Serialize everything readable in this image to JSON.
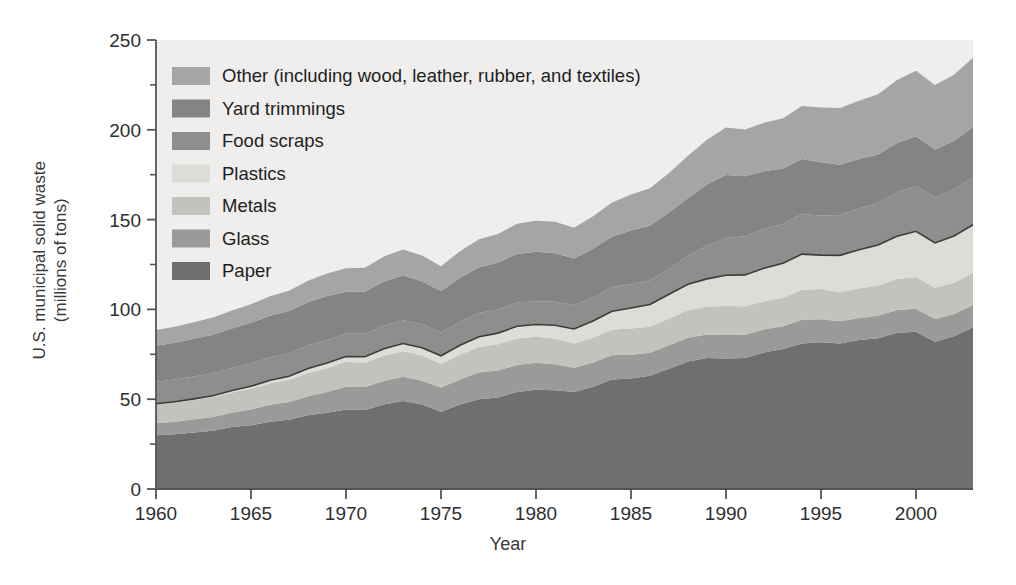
{
  "axes": {
    "ylabel_line1": "U.S. municipal solid waste",
    "ylabel_line2": "(millions of tons)",
    "xlabel": "Year",
    "y_ticks": [
      "0",
      "50",
      "100",
      "150",
      "200",
      "250"
    ],
    "x_ticks": [
      "1960",
      "1965",
      "1970",
      "1975",
      "1980",
      "1985",
      "1990",
      "1995",
      "2000"
    ]
  },
  "legend": {
    "items": [
      {
        "label": "Other (including wood, leather, rubber, and textiles)",
        "color": "#a5a5a3"
      },
      {
        "label": "Yard trimmings",
        "color": "#848482"
      },
      {
        "label": "Food scraps",
        "color": "#8e8e8c"
      },
      {
        "label": "Plastics",
        "color": "#dcdcd8"
      },
      {
        "label": "Metals",
        "color": "#c2c2be"
      },
      {
        "label": "Glass",
        "color": "#9a9a98"
      },
      {
        "label": "Paper",
        "color": "#6f6f6d"
      }
    ]
  },
  "style": {
    "plot_bg": "#efeeec",
    "axis_color": "#555553",
    "outline_color": "#3c3c3a",
    "page_bg": "#ffffff"
  },
  "chart_data": {
    "type": "area",
    "stacked": true,
    "title": "",
    "xlabel": "Year",
    "ylabel": "U.S. municipal solid waste (millions of tons)",
    "xlim": [
      1960,
      2003
    ],
    "ylim": [
      0,
      250
    ],
    "y_ticks": [
      0,
      50,
      100,
      150,
      200,
      250
    ],
    "y_minor_ticks": [
      25,
      75,
      125,
      175,
      225
    ],
    "x_ticks": [
      1960,
      1965,
      1970,
      1975,
      1980,
      1985,
      1990,
      1995,
      2000
    ],
    "grid": false,
    "legend_position": "upper-left-inside",
    "x": [
      1960,
      1961,
      1962,
      1963,
      1964,
      1965,
      1966,
      1967,
      1968,
      1969,
      1970,
      1971,
      1972,
      1973,
      1974,
      1975,
      1976,
      1977,
      1978,
      1979,
      1980,
      1981,
      1982,
      1983,
      1984,
      1985,
      1986,
      1987,
      1988,
      1989,
      1990,
      1991,
      1992,
      1993,
      1994,
      1995,
      1996,
      1997,
      1998,
      1999,
      2000,
      2001,
      2002,
      2003
    ],
    "series": [
      {
        "name": "Paper",
        "color": "#6f6f6d",
        "values": [
          29.9,
          30.5,
          31.5,
          32.5,
          34.5,
          35.5,
          37.5,
          38.5,
          41.0,
          42.5,
          44.3,
          44.0,
          47.0,
          49.0,
          47.0,
          43.0,
          47.0,
          50.0,
          51.0,
          54.0,
          55.2,
          55.0,
          54.0,
          57.0,
          61.0,
          61.5,
          63.0,
          67.0,
          71.0,
          73.0,
          72.7,
          73.0,
          76.0,
          78.0,
          81.0,
          81.7,
          81.0,
          83.0,
          84.0,
          87.0,
          87.5,
          82.0,
          85.0,
          90.0
        ]
      },
      {
        "name": "Glass",
        "color": "#9a9a98",
        "values": [
          6.7,
          7.0,
          7.3,
          7.6,
          8.0,
          8.7,
          9.4,
          10.0,
          10.7,
          11.5,
          12.7,
          12.8,
          13.2,
          13.5,
          13.3,
          13.5,
          14.0,
          14.8,
          15.0,
          15.0,
          15.1,
          14.5,
          13.5,
          13.5,
          13.5,
          13.2,
          12.9,
          13.0,
          13.2,
          13.0,
          13.1,
          12.9,
          12.8,
          12.6,
          13.2,
          12.8,
          12.4,
          12.2,
          12.4,
          12.6,
          12.8,
          12.6,
          12.4,
          12.5
        ]
      },
      {
        "name": "Metals",
        "color": "#c2c2be",
        "values": [
          10.5,
          10.6,
          10.8,
          11.0,
          11.3,
          11.6,
          12.0,
          12.3,
          12.9,
          13.2,
          13.8,
          13.5,
          14.0,
          14.2,
          14.0,
          13.2,
          13.8,
          14.3,
          14.6,
          14.8,
          14.5,
          14.1,
          13.5,
          13.7,
          14.2,
          14.6,
          14.5,
          14.9,
          15.3,
          15.5,
          16.1,
          15.8,
          15.6,
          15.9,
          16.6,
          16.8,
          16.2,
          16.5,
          16.9,
          17.3,
          17.7,
          17.4,
          17.5,
          17.9
        ]
      },
      {
        "name": "Plastics",
        "color": "#dcdcd8",
        "values": [
          0.4,
          0.5,
          0.6,
          0.8,
          1.0,
          1.4,
          1.7,
          2.0,
          2.5,
          2.9,
          3.0,
          3.3,
          3.9,
          4.3,
          4.4,
          4.5,
          5.2,
          5.7,
          6.2,
          6.8,
          6.8,
          7.6,
          8.1,
          9.3,
          10.3,
          11.5,
          12.3,
          13.5,
          14.5,
          15.5,
          17.1,
          17.5,
          18.5,
          19.2,
          20.0,
          18.9,
          20.5,
          21.5,
          22.5,
          23.8,
          25.5,
          25.0,
          26.0,
          26.7
        ]
      },
      {
        "name": "Food scraps",
        "color": "#8e8e8c",
        "values": [
          12.2,
          12.3,
          12.4,
          12.5,
          12.6,
          12.7,
          12.8,
          12.8,
          12.9,
          12.9,
          12.8,
          12.8,
          12.9,
          12.9,
          13.0,
          13.0,
          13.1,
          13.2,
          13.2,
          13.3,
          13.0,
          13.1,
          13.2,
          13.3,
          13.5,
          13.2,
          13.5,
          14.0,
          16.0,
          18.5,
          20.8,
          21.5,
          22.0,
          21.8,
          22.5,
          21.9,
          22.5,
          23.0,
          23.5,
          24.5,
          25.2,
          25.5,
          25.8,
          26.5
        ]
      },
      {
        "name": "Yard trimmings",
        "color": "#848482",
        "values": [
          20.0,
          20.5,
          21.0,
          21.5,
          22.0,
          22.6,
          23.0,
          23.5,
          24.0,
          24.5,
          23.2,
          23.5,
          24.5,
          25.0,
          24.0,
          23.0,
          24.5,
          25.5,
          26.0,
          27.0,
          27.5,
          27.0,
          26.0,
          27.0,
          28.0,
          30.0,
          30.5,
          31.5,
          32.0,
          34.0,
          35.0,
          33.5,
          32.0,
          31.0,
          30.5,
          29.8,
          28.0,
          27.5,
          27.0,
          27.5,
          27.7,
          26.5,
          27.0,
          28.0
        ]
      },
      {
        "name": "Other (including wood, leather, rubber, and textiles)",
        "color": "#a5a5a3",
        "values": [
          8.8,
          9.0,
          9.3,
          9.6,
          10.0,
          10.4,
          10.9,
          11.3,
          12.0,
          12.5,
          13.1,
          13.3,
          14.0,
          14.5,
          14.3,
          13.8,
          14.8,
          15.5,
          16.0,
          16.8,
          17.2,
          17.5,
          17.2,
          18.0,
          19.0,
          20.0,
          20.8,
          22.0,
          23.5,
          25.0,
          26.5,
          26.0,
          27.0,
          28.0,
          29.5,
          30.5,
          31.5,
          32.5,
          33.5,
          35.0,
          36.5,
          36.0,
          37.0,
          38.5
        ]
      }
    ]
  }
}
